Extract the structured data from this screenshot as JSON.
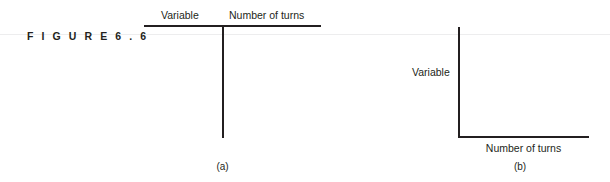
{
  "figure": {
    "label": "F I G U R E   6 . 6",
    "label_plain": "FIGURE 6.6"
  },
  "panel_a": {
    "caption": "(a)",
    "table": {
      "columns": [
        "Variable",
        "Number of turns"
      ],
      "rows": []
    }
  },
  "panel_b": {
    "caption": "(b)",
    "chart": {
      "ylabel": "Variable",
      "xlabel": "Number of turns"
    }
  },
  "chart_data": [
    {
      "type": "table",
      "title": "",
      "categories": [
        "Variable",
        "Number of turns"
      ],
      "columns": [
        "Variable",
        "Number of turns"
      ],
      "rows": [],
      "annotations": [
        "(a)"
      ],
      "grid": false,
      "legend": "none"
    },
    {
      "type": "line",
      "title": "",
      "x": [],
      "values": [],
      "series": [],
      "xlabel": "Number of turns",
      "ylabel": "Variable",
      "xticklabels": [],
      "yticklabels": [],
      "xlim": null,
      "ylim": null,
      "grid": false,
      "legend": "none",
      "annotations": [
        "(b)"
      ]
    }
  ],
  "colors": {
    "ink": "#231f20",
    "hairline": "#ededee",
    "background": "#ffffff"
  }
}
